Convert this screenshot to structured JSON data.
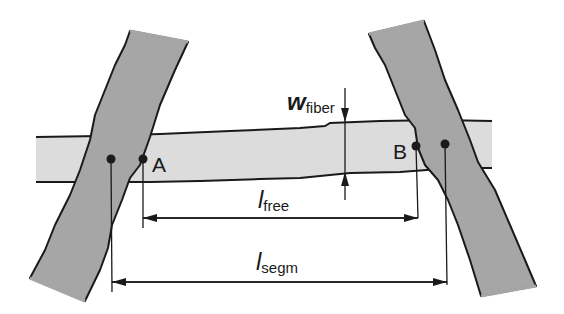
{
  "diagram": {
    "type": "fiber-bond-schematic",
    "colors": {
      "background": "#ffffff",
      "crossing_fiber": "#a6a6a6",
      "free_fiber": "#dcdcdc",
      "outline": "#1a1a1a"
    },
    "points": [
      {
        "id": "A",
        "label": "A"
      },
      {
        "id": "B",
        "label": "B"
      }
    ],
    "dimensions": {
      "w_fiber": {
        "symbol": "w",
        "subscript": "fiber"
      },
      "l_free": {
        "symbol": "l",
        "subscript": "free"
      },
      "l_segm": {
        "symbol": "l",
        "subscript": "segm"
      }
    }
  }
}
